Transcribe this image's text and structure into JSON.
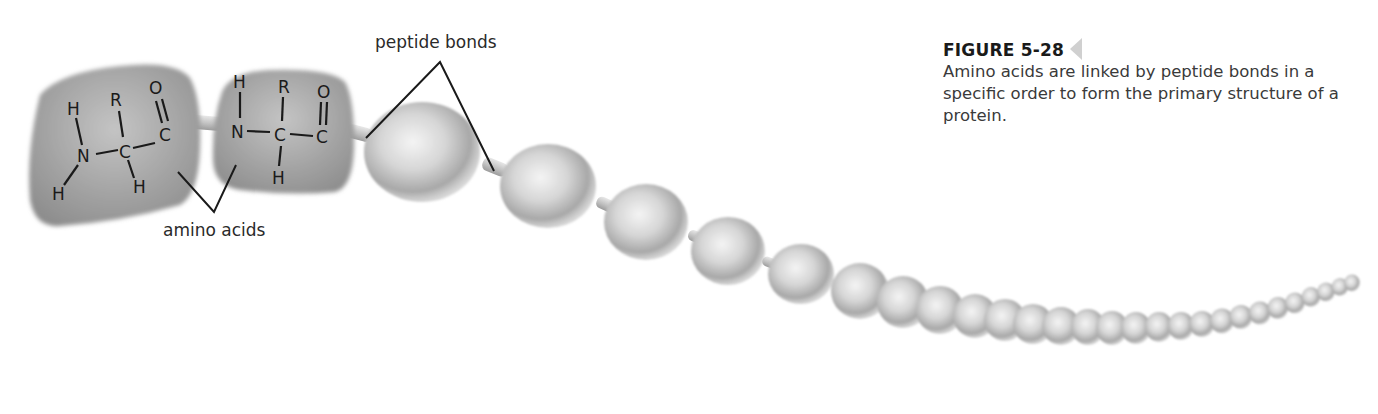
{
  "figure": {
    "number": "FIGURE 5-28",
    "caption": "Amino acids are linked by peptide bonds in a specific order to form the primary structure of a protein."
  },
  "labels": {
    "peptide_bonds": "peptide bonds",
    "amino_acids": "amino acids"
  },
  "amino_acid_1": {
    "atoms": {
      "h_top": "H",
      "n": "N",
      "h_bottom_left": "H",
      "r": "R",
      "c_alpha": "C",
      "h_alpha": "H",
      "o": "O",
      "c_carbonyl": "C"
    }
  },
  "amino_acid_2": {
    "atoms": {
      "h_top": "H",
      "n": "N",
      "r": "R",
      "c_alpha": "C",
      "h_alpha": "H",
      "o": "O",
      "c_carbonyl": "C"
    }
  },
  "chain": {
    "bead_count": 30,
    "colors": {
      "bead_light": "#f2f2f2",
      "bead_mid": "#c8c8c8",
      "bead_dark": "#8a8a8a",
      "block": "#9a9a9a",
      "line": "#1a1a1a"
    }
  }
}
